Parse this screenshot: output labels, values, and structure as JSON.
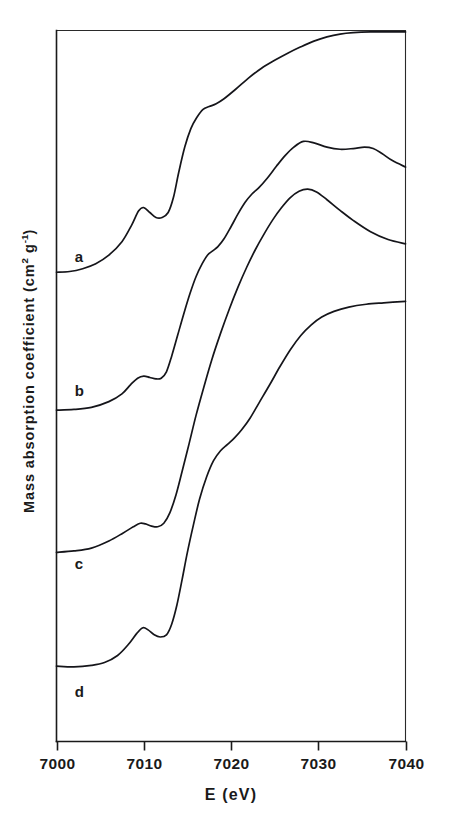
{
  "figure": {
    "background_color": "#ffffff",
    "line_color": "#15151a",
    "axis_color": "#1a1a1a"
  },
  "axes": {
    "x_title": "E (eV)",
    "y_title_main": "Mass absorption coefficient (cm",
    "y_title_sup1": "2",
    "y_title_mid": " g",
    "y_title_sup2": "-1",
    "y_title_end": ")",
    "x_ticks": [
      "7000",
      "7010",
      "7020",
      "7030",
      "7040"
    ],
    "x_tick_values": [
      7000,
      7010,
      7020,
      7030,
      7040
    ],
    "x_min": 7000,
    "x_max": 7040,
    "y_ticks_visible": false,
    "grid": false
  },
  "curve_labels": [
    {
      "text": "a",
      "x": 7002.1,
      "y_px": 262
    },
    {
      "text": "b",
      "x": 7002.1,
      "y_px": 396
    },
    {
      "text": "c",
      "x": 7002.1,
      "y_px": 569
    },
    {
      "text": "d",
      "x": 7002.1,
      "y_px": 697
    }
  ],
  "chart_data": {
    "type": "line",
    "title": "",
    "subtitle": "",
    "xlabel": "E (eV)",
    "ylabel": "Mass absorption coefficient (cm2 g-1)",
    "xlim": [
      7000,
      7040
    ],
    "ylim": [
      0,
      1
    ],
    "grid": false,
    "legend": "inline curve labels a, b, c, d at left of each baseline",
    "note": "X-ray absorption near-edge (XANES) spectra; four curves vertically offset, arbitrary units on ordinate",
    "annotations": [
      {
        "label": "a",
        "description": "top spectrum, pre-edge peak near 7010 eV, saturates near 7033 eV"
      },
      {
        "label": "b",
        "description": "second spectrum, white-line maximum near 7028 eV with shoulder near 7036 eV"
      },
      {
        "label": "c",
        "description": "third spectrum, white-line maximum near 7029 eV then gradual decline"
      },
      {
        "label": "d",
        "description": "bottom spectrum, sharp pre-edge peak near 7010 eV, smooth rise saturating near 7032 eV"
      }
    ],
    "series": [
      {
        "name": "a",
        "baseline_level": 0.66,
        "x": [
          7000.0,
          7001.5,
          7003.0,
          7004.5,
          7006.0,
          7007.5,
          7008.6,
          7009.4,
          7010.0,
          7010.7,
          7011.4,
          7012.1,
          7012.8,
          7013.4,
          7014.0,
          7014.7,
          7015.4,
          7016.1,
          7016.8,
          7017.5,
          7018.3,
          7019.2,
          7020.5,
          7022.0,
          7023.5,
          7025.0,
          7026.5,
          7028.0,
          7029.5,
          7031.0,
          7032.5,
          7034.0,
          7036.0,
          7038.0,
          7040.0
        ],
        "y": [
          0.66,
          0.661,
          0.665,
          0.672,
          0.684,
          0.703,
          0.726,
          0.746,
          0.751,
          0.744,
          0.737,
          0.737,
          0.744,
          0.765,
          0.8,
          0.836,
          0.862,
          0.878,
          0.889,
          0.893,
          0.897,
          0.904,
          0.917,
          0.933,
          0.947,
          0.958,
          0.968,
          0.977,
          0.985,
          0.991,
          0.995,
          0.997,
          0.998,
          0.998,
          0.998
        ]
      },
      {
        "name": "b",
        "baseline_level": 0.466,
        "x": [
          7000.0,
          7002.0,
          7004.0,
          7006.0,
          7007.5,
          7008.5,
          7009.3,
          7010.0,
          7010.7,
          7011.4,
          7012.0,
          7012.6,
          7013.2,
          7013.9,
          7014.6,
          7015.3,
          7016.0,
          7016.7,
          7017.3,
          7017.9,
          7018.5,
          7019.2,
          7020.0,
          7020.8,
          7021.6,
          7022.4,
          7023.2,
          7024.2,
          7025.2,
          7026.2,
          7027.2,
          7028.3,
          7029.5,
          7031.0,
          7032.5,
          7034.0,
          7035.3,
          7036.3,
          7037.3,
          7038.5,
          7040.0
        ],
        "y": [
          0.466,
          0.467,
          0.47,
          0.478,
          0.489,
          0.502,
          0.511,
          0.514,
          0.512,
          0.51,
          0.511,
          0.52,
          0.542,
          0.572,
          0.602,
          0.63,
          0.654,
          0.672,
          0.684,
          0.69,
          0.696,
          0.707,
          0.724,
          0.742,
          0.758,
          0.77,
          0.779,
          0.793,
          0.809,
          0.824,
          0.836,
          0.844,
          0.842,
          0.836,
          0.833,
          0.834,
          0.836,
          0.834,
          0.827,
          0.817,
          0.808
        ]
      },
      {
        "name": "c",
        "baseline_level": 0.266,
        "x": [
          7000.0,
          7002.0,
          7004.0,
          7006.0,
          7007.6,
          7008.8,
          7009.6,
          7010.2,
          7010.9,
          7011.6,
          7012.3,
          7013.0,
          7013.7,
          7014.4,
          7015.2,
          7016.0,
          7016.9,
          7017.8,
          7018.8,
          7019.8,
          7020.8,
          7021.8,
          7022.8,
          7023.8,
          7024.8,
          7025.8,
          7026.8,
          7027.8,
          7028.8,
          7029.8,
          7031.0,
          7032.5,
          7034.0,
          7036.0,
          7038.0,
          7040.0
        ],
        "y": [
          0.266,
          0.268,
          0.272,
          0.282,
          0.293,
          0.302,
          0.307,
          0.306,
          0.303,
          0.302,
          0.307,
          0.322,
          0.347,
          0.38,
          0.419,
          0.459,
          0.499,
          0.537,
          0.574,
          0.608,
          0.639,
          0.667,
          0.692,
          0.714,
          0.734,
          0.751,
          0.765,
          0.774,
          0.777,
          0.773,
          0.762,
          0.747,
          0.733,
          0.717,
          0.706,
          0.7
        ]
      },
      {
        "name": "d",
        "baseline_level": 0.106,
        "x": [
          7000.0,
          7002.0,
          7004.0,
          7005.5,
          7007.0,
          7008.2,
          7009.2,
          7009.9,
          7010.5,
          7011.2,
          7011.9,
          7012.6,
          7013.2,
          7013.8,
          7014.4,
          7015.0,
          7015.7,
          7016.4,
          7017.2,
          7018.0,
          7018.8,
          7019.6,
          7020.4,
          7021.2,
          7022.2,
          7023.2,
          7024.4,
          7025.6,
          7026.8,
          7028.0,
          7029.2,
          7030.4,
          7031.8,
          7033.5,
          7035.5,
          7037.5,
          7040.0
        ],
        "y": [
          0.106,
          0.105,
          0.107,
          0.111,
          0.121,
          0.136,
          0.152,
          0.16,
          0.157,
          0.15,
          0.147,
          0.15,
          0.165,
          0.192,
          0.228,
          0.266,
          0.305,
          0.341,
          0.372,
          0.395,
          0.409,
          0.418,
          0.427,
          0.438,
          0.455,
          0.476,
          0.501,
          0.527,
          0.551,
          0.571,
          0.586,
          0.597,
          0.605,
          0.611,
          0.615,
          0.617,
          0.619
        ]
      }
    ]
  }
}
